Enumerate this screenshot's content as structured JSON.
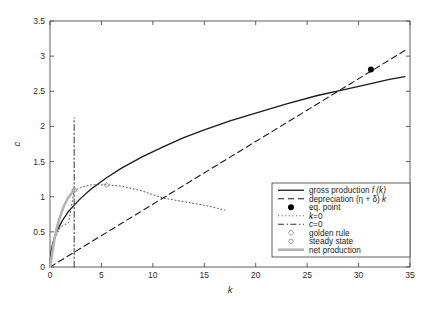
{
  "chart_data": {
    "type": "line",
    "title": "",
    "xlabel": "k",
    "ylabel": "c",
    "xlim": [
      0,
      35
    ],
    "ylim": [
      0,
      3.5
    ],
    "xticks": [
      0,
      5,
      10,
      15,
      20,
      25,
      30,
      35
    ],
    "yticks": [
      0,
      0.5,
      1,
      1.5,
      2,
      2.5,
      3,
      3.5
    ],
    "xtick_labels": [
      "0",
      "5",
      "10",
      "15",
      "20",
      "25",
      "30",
      "35"
    ],
    "ytick_labels": [
      "0",
      "0.5",
      "1",
      "1.5",
      "2",
      "2.5",
      "3",
      "3.5"
    ],
    "grid": false,
    "legend_position": "lower right",
    "model": {
      "tfp": 0.62,
      "alpha": 0.43,
      "depreciation_slope": 0.0893
    },
    "series": [
      {
        "name": "gross production f (k)",
        "style": "solid",
        "color": "#1a1a1a",
        "width": 1.3,
        "x": [
          0,
          0.1,
          0.25,
          0.5,
          0.8,
          1.2,
          1.8,
          2.35,
          3,
          4,
          5.5,
          7,
          9,
          11,
          13,
          15,
          17.5,
          20,
          23,
          26,
          28.5,
          31.2,
          33,
          34.5
        ],
        "y": [
          0,
          0.22,
          0.33,
          0.45,
          0.55,
          0.66,
          0.79,
          0.88,
          0.98,
          1.11,
          1.27,
          1.41,
          1.57,
          1.71,
          1.84,
          1.95,
          2.08,
          2.19,
          2.32,
          2.44,
          2.52,
          2.61,
          2.67,
          2.71
        ]
      },
      {
        "name": "depreciation (η + δ) k",
        "style": "dashed",
        "color": "#1a1a1a",
        "width": 1.1,
        "x": [
          0,
          34.5
        ],
        "y": [
          0,
          3.08
        ]
      },
      {
        "name": "k=0",
        "label_base": "k",
        "label_dot": true,
        "label_tail": "=0",
        "style": "dotted",
        "color": "#555555",
        "width": 1.0,
        "x": [
          0.25,
          0.5,
          1,
          1.8,
          2.35,
          3,
          4,
          5.5,
          7,
          9,
          11,
          13,
          15,
          17
        ],
        "y": [
          0.31,
          0.41,
          0.57,
          0.63,
          1.09,
          1.13,
          1.17,
          1.17,
          1.15,
          1.08,
          0.98,
          0.93,
          0.88,
          0.81
        ]
      },
      {
        "name": "c=0",
        "label_base": "c",
        "label_dot": true,
        "label_tail": "=0",
        "style": "dashdot",
        "color": "#333333",
        "width": 1.0,
        "x": [
          2.35,
          2.35
        ],
        "y": [
          0,
          2.12
        ]
      },
      {
        "name": "net production",
        "style": "solid",
        "color": "#b4b4b4",
        "width": 2.6,
        "x": [
          0,
          0.15,
          0.35,
          0.6,
          0.9,
          1.3,
          1.7,
          2.0,
          2.2,
          2.35
        ],
        "y": [
          0,
          0.13,
          0.33,
          0.52,
          0.68,
          0.85,
          0.97,
          1.03,
          1.07,
          1.09
        ]
      }
    ],
    "markers": [
      {
        "name": "eq. point",
        "shape": "filled-circle",
        "color": "#000000",
        "x": 31.2,
        "y": 2.81,
        "size": 5.2
      },
      {
        "name": "golden rule",
        "shape": "diamond",
        "color": "#9a9a9a",
        "x": 5.5,
        "y": 1.17,
        "size": 5.0
      },
      {
        "name": "steady state",
        "shape": "circle",
        "color": "#9a9a9a",
        "x": 2.35,
        "y": 1.09,
        "size": 4.2
      }
    ],
    "legend": [
      {
        "label": "gross production f (k)",
        "plain": "gross production ",
        "italic": "f (k)",
        "sample": "line-solid",
        "color": "#1a1a1a"
      },
      {
        "label": "depreciation (η + δ) k",
        "plain": "depreciation (η + δ) ",
        "italic": "k",
        "sample": "line-dashed",
        "color": "#1a1a1a"
      },
      {
        "label": "eq. point",
        "plain": "eq. point",
        "italic": "",
        "sample": "marker-filled-circle",
        "color": "#000000"
      },
      {
        "label": "k̇=0",
        "plain": "",
        "italic": "k",
        "dotted_accent": true,
        "tail": "=0",
        "sample": "line-dotted",
        "color": "#555555"
      },
      {
        "label": "ċ=0",
        "plain": "",
        "italic": "c",
        "dotted_accent": true,
        "tail": "=0",
        "sample": "line-dashdot",
        "color": "#333333"
      },
      {
        "label": "golden rule",
        "plain": "golden rule",
        "italic": "",
        "sample": "marker-diamond",
        "color": "#9a9a9a"
      },
      {
        "label": "steady state",
        "plain": "steady state",
        "italic": "",
        "sample": "marker-circle",
        "color": "#9a9a9a"
      },
      {
        "label": "net production",
        "plain": "net production",
        "italic": "",
        "sample": "line-thick-gray",
        "color": "#b4b4b4"
      }
    ]
  },
  "axes": {
    "x_label": "k",
    "y_label": "c"
  },
  "colors": {
    "axis": "#4d4d4d",
    "background": "#ffffff",
    "primary": "#1a1a1a",
    "gray_series": "#b4b4b4",
    "marker_gray": "#9a9a9a"
  }
}
